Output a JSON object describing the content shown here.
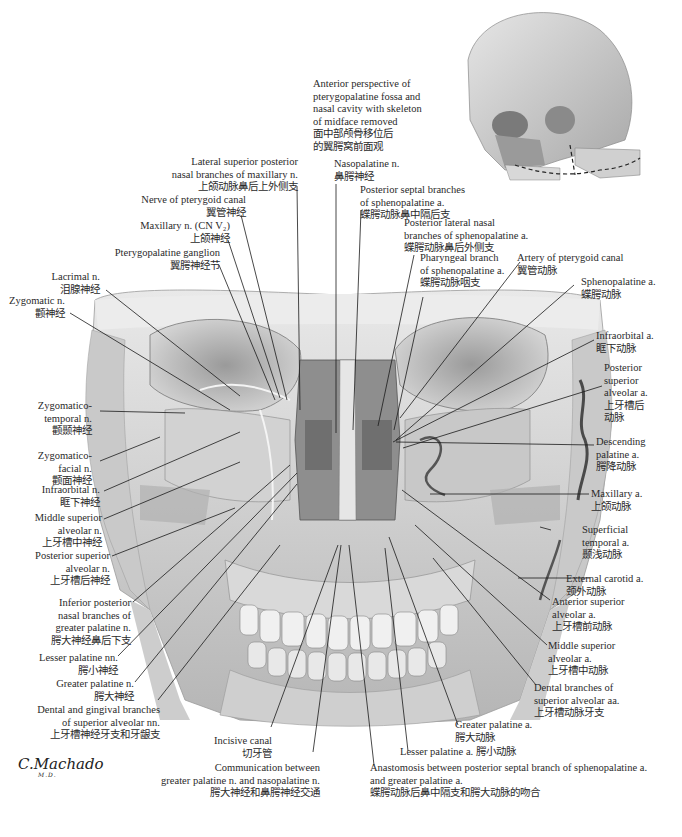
{
  "figure": {
    "inset_caption": {
      "en": [
        "Anterior perspective of",
        "pterygopalatine fossa and",
        "nasal cavity with skeleton",
        "of midface removed"
      ],
      "zh": [
        "面中部颅骨移位后",
        "的翼腭窝前面观"
      ]
    },
    "signature": {
      "name": "C.Machado",
      "suffix": "M.D."
    },
    "colors": {
      "background": "#ffffff",
      "bone_light": "#e4e4e4",
      "bone_mid": "#bdbdbd",
      "bone_dark": "#6e6e6e",
      "leader": "#1a1a1a",
      "text": "#2a2a2a"
    }
  },
  "labels": {
    "lateral_sup_post_nasal": {
      "en": [
        "Lateral superior posterior",
        "nasal branches of maxillary n."
      ],
      "zh": "上颌动脉鼻后上外侧支"
    },
    "nerve_pterygoid_canal": {
      "en": [
        "Nerve of pterygoid canal"
      ],
      "zh": "翼管神经"
    },
    "maxillary_n": {
      "en": [
        "Maxillary n. (CN V₂)"
      ],
      "zh": "上颌神经"
    },
    "pterygopalatine_ganglion": {
      "en": [
        "Pterygopalatine ganglion"
      ],
      "zh": "翼腭神经节"
    },
    "lacrimal_n": {
      "en": [
        "Lacrimal n."
      ],
      "zh": "泪腺神经"
    },
    "zygomatic_n": {
      "en": [
        "Zygomatic n."
      ],
      "zh": "颧神经"
    },
    "zygomaticotemporal_n": {
      "en": [
        "Zygomatico-",
        "temporal n."
      ],
      "zh": "颧颞神经"
    },
    "zygomaticofacial_n": {
      "en": [
        "Zygomatico-",
        "facial n."
      ],
      "zh": "颧面神经"
    },
    "infraorbital_n": {
      "en": [
        "Infraorbital n."
      ],
      "zh": "眶下神经"
    },
    "middle_sup_alveolar_n": {
      "en": [
        "Middle superior",
        "alveolar n."
      ],
      "zh": "上牙槽中神经"
    },
    "posterior_sup_alveolar_n": {
      "en": [
        "Posterior superior",
        "alveolar n."
      ],
      "zh": "上牙槽后神经"
    },
    "inferior_posterior_nasal": {
      "en": [
        "Inferior posterior",
        "nasal branches of",
        "greater palatine n."
      ],
      "zh": "腭大神经鼻后下支"
    },
    "lesser_palatine_nn": {
      "en": [
        "Lesser palatine nn."
      ],
      "zh": "腭小神经"
    },
    "greater_palatine_n": {
      "en": [
        "Greater palatine n."
      ],
      "zh": "腭大神经"
    },
    "dental_gingival_branches": {
      "en": [
        "Dental and gingival branches",
        "of superior alveolar nn."
      ],
      "zh": "上牙槽神经牙支和牙龈支"
    },
    "incisive_canal": {
      "en": [
        "Incisive canal"
      ],
      "zh": "切牙管"
    },
    "communication": {
      "en": [
        "Communication between",
        "greater palatine n. and nasopalatine n."
      ],
      "zh": "腭大神经和鼻腭神经交通"
    },
    "nasopalatine_n": {
      "en": [
        "Nasopalatine n."
      ],
      "zh": "鼻腭神经"
    },
    "posterior_septal_branches": {
      "en": [
        "Posterior septal branches",
        "of sphenopalatine a."
      ],
      "zh": "蝶腭动脉鼻中隔后支"
    },
    "posterior_lateral_nasal": {
      "en": [
        "Posterior lateral nasal",
        "branches of sphenopalatine a."
      ],
      "zh": "蝶腭动脉鼻后外侧支"
    },
    "pharyngeal_branch": {
      "en": [
        "Pharyngeal branch",
        "of sphenopalatine a."
      ],
      "zh": "蝶腭动脉咽支"
    },
    "artery_pterygoid_canal": {
      "en": [
        "Artery of pterygoid canal"
      ],
      "zh": "翼管动脉"
    },
    "sphenopalatine_a": {
      "en": [
        "Sphenopalatine a."
      ],
      "zh": "蝶腭动脉"
    },
    "infraorbital_a": {
      "en": [
        "Infraorbital a."
      ],
      "zh": "眶下动脉"
    },
    "posterior_sup_alveolar_a": {
      "en": [
        "Posterior",
        "superior",
        "alveolar a."
      ],
      "zh": [
        "上牙槽后",
        "动脉"
      ]
    },
    "descending_palatine_a": {
      "en": [
        "Descending",
        "palatine a."
      ],
      "zh": "腭降动脉"
    },
    "maxillary_a": {
      "en": [
        "Maxillary a."
      ],
      "zh": "上颌动脉"
    },
    "superficial_temporal_a": {
      "en": [
        "Superficial",
        "temporal a."
      ],
      "zh": "颞浅动脉"
    },
    "external_carotid_a": {
      "en": [
        "External carotid a."
      ],
      "zh": "颈外动脉"
    },
    "anterior_sup_alveolar_a": {
      "en": [
        "Anterior superior",
        "alveolar a."
      ],
      "zh": "上牙槽前动脉"
    },
    "middle_sup_alveolar_a": {
      "en": [
        "Middle superior",
        "alveolar a."
      ],
      "zh": "上牙槽中动脉"
    },
    "dental_branches_sup_alveolar_aa": {
      "en": [
        "Dental branches of",
        "superior alveolar aa."
      ],
      "zh": "上牙槽动脉牙支"
    },
    "greater_palatine_a": {
      "en": [
        "Greater palatine a."
      ],
      "zh": "腭大动脉"
    },
    "lesser_palatine_a": {
      "en": [
        "Lesser palatine a. 腭小动脉"
      ]
    },
    "anastomosis": {
      "en": [
        "Anastomosis between posterior septal branch of sphenopalatine a.",
        "and greater palatine a."
      ],
      "zh": "蝶腭动脉后鼻中隔支和腭大动脉的吻合"
    }
  }
}
